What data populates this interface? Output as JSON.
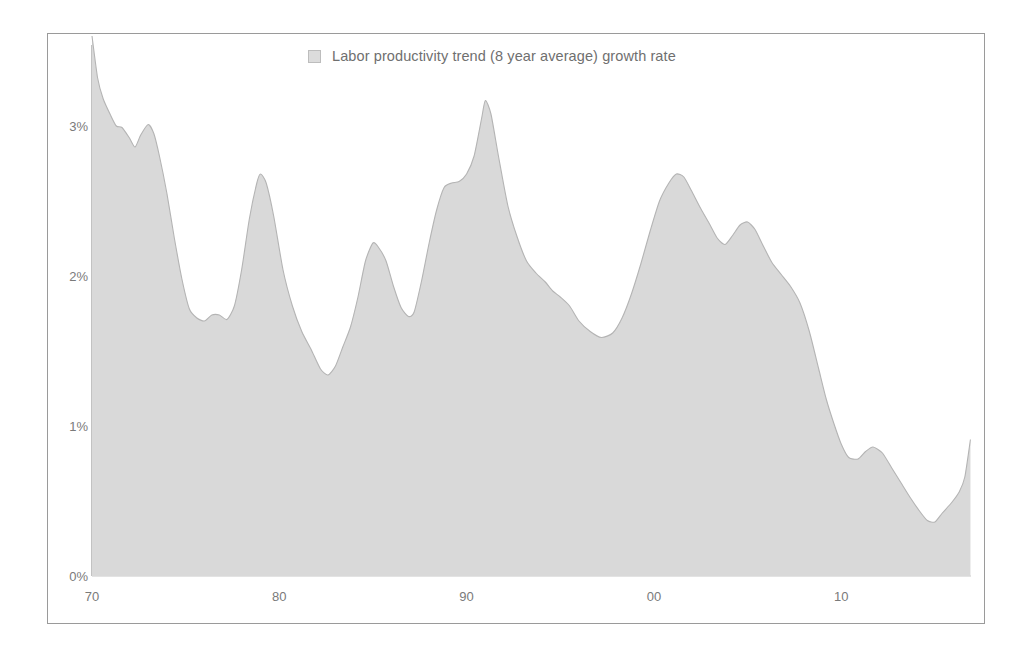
{
  "chart_data": {
    "type": "area",
    "title": "",
    "subtitle": "",
    "xlabel": "",
    "ylabel": "",
    "legend": {
      "position": "top-center",
      "entries": [
        {
          "name": "Labor productivity trend (8 year average) growth rate",
          "color": "#d9d9d9"
        }
      ]
    },
    "grid": false,
    "xlim": [
      1970,
      2017
    ],
    "ylim": [
      0,
      3.6
    ],
    "y_tick_labels": [
      "0%",
      "1%",
      "2%",
      "3%"
    ],
    "y_tick_values": [
      0,
      1,
      2,
      3
    ],
    "x_tick_labels": [
      "70",
      "80",
      "90",
      "00",
      "10"
    ],
    "x_tick_values": [
      1970,
      1980,
      1990,
      2000,
      2010
    ],
    "y_unit": "percent",
    "series": [
      {
        "name": "Labor productivity trend (8 year average) growth rate",
        "color": "#d9d9d9",
        "line_color": "#b0b0b0",
        "x": [
          1970.0,
          1970.3,
          1970.6,
          1971.0,
          1971.3,
          1971.6,
          1972.0,
          1972.3,
          1972.6,
          1973.0,
          1973.3,
          1973.6,
          1974.0,
          1974.4,
          1974.8,
          1975.2,
          1975.6,
          1976.0,
          1976.4,
          1976.8,
          1977.2,
          1977.6,
          1978.0,
          1978.4,
          1978.8,
          1979.0,
          1979.3,
          1979.7,
          1980.2,
          1980.7,
          1981.2,
          1981.7,
          1982.2,
          1982.6,
          1983.0,
          1983.4,
          1983.8,
          1984.2,
          1984.6,
          1985.0,
          1985.3,
          1985.7,
          1986.1,
          1986.5,
          1986.9,
          1987.2,
          1987.6,
          1988.0,
          1988.4,
          1988.8,
          1989.2,
          1989.6,
          1990.0,
          1990.4,
          1990.8,
          1991.0,
          1991.3,
          1991.7,
          1992.2,
          1992.7,
          1993.2,
          1993.7,
          1994.2,
          1994.6,
          1995.0,
          1995.5,
          1996.0,
          1996.6,
          1997.2,
          1997.8,
          1998.3,
          1998.8,
          1999.3,
          1999.8,
          2000.3,
          2000.8,
          2001.2,
          2001.6,
          2002.0,
          2002.5,
          2003.0,
          2003.4,
          2003.8,
          2004.2,
          2004.6,
          2005.0,
          2005.4,
          2005.8,
          2006.3,
          2006.8,
          2007.3,
          2007.8,
          2008.3,
          2008.8,
          2009.2,
          2009.6,
          2010.0,
          2010.4,
          2010.9,
          2011.3,
          2011.7,
          2012.2,
          2012.7,
          2013.2,
          2013.7,
          2014.2,
          2014.6,
          2015.0,
          2015.4,
          2015.9,
          2016.3,
          2016.6,
          2016.9
        ],
        "y": [
          3.6,
          3.32,
          3.18,
          3.07,
          3.0,
          2.99,
          2.92,
          2.86,
          2.94,
          3.01,
          2.95,
          2.8,
          2.55,
          2.25,
          1.98,
          1.78,
          1.72,
          1.7,
          1.74,
          1.74,
          1.71,
          1.8,
          2.05,
          2.38,
          2.62,
          2.68,
          2.62,
          2.4,
          2.04,
          1.8,
          1.63,
          1.51,
          1.38,
          1.34,
          1.4,
          1.53,
          1.66,
          1.86,
          2.1,
          2.22,
          2.19,
          2.1,
          1.93,
          1.79,
          1.73,
          1.76,
          1.97,
          2.22,
          2.44,
          2.59,
          2.62,
          2.63,
          2.68,
          2.8,
          3.05,
          3.17,
          3.08,
          2.8,
          2.47,
          2.26,
          2.1,
          2.02,
          1.96,
          1.9,
          1.86,
          1.8,
          1.7,
          1.63,
          1.59,
          1.62,
          1.72,
          1.88,
          2.08,
          2.3,
          2.5,
          2.62,
          2.68,
          2.66,
          2.57,
          2.45,
          2.34,
          2.25,
          2.21,
          2.27,
          2.34,
          2.36,
          2.31,
          2.21,
          2.09,
          2.01,
          1.93,
          1.82,
          1.63,
          1.38,
          1.18,
          1.02,
          0.88,
          0.79,
          0.78,
          0.83,
          0.86,
          0.82,
          0.72,
          0.62,
          0.52,
          0.43,
          0.37,
          0.36,
          0.42,
          0.49,
          0.56,
          0.66,
          0.91
        ]
      }
    ]
  },
  "legend": {
    "swatch_color": "#d9d9d9",
    "label": "Labor productivity trend (8 year average) growth rate"
  },
  "axes": {
    "y_ticks": [
      {
        "label": "3%",
        "value": 3
      },
      {
        "label": "2%",
        "value": 2
      },
      {
        "label": "1%",
        "value": 1
      },
      {
        "label": "0%",
        "value": 0
      }
    ],
    "x_ticks": [
      {
        "label": "70",
        "value": 1970
      },
      {
        "label": "80",
        "value": 1980
      },
      {
        "label": "90",
        "value": 1990
      },
      {
        "label": "00",
        "value": 2000
      },
      {
        "label": "10",
        "value": 2010
      }
    ]
  },
  "colors": {
    "area_fill": "#d9d9d9",
    "area_stroke": "#b4b4b4",
    "frame_border": "#9a9a9a",
    "axis_line": "#9a9a9a",
    "tick_text": "#7a7a7a",
    "legend_text": "#6f6f6f",
    "background": "#ffffff"
  }
}
